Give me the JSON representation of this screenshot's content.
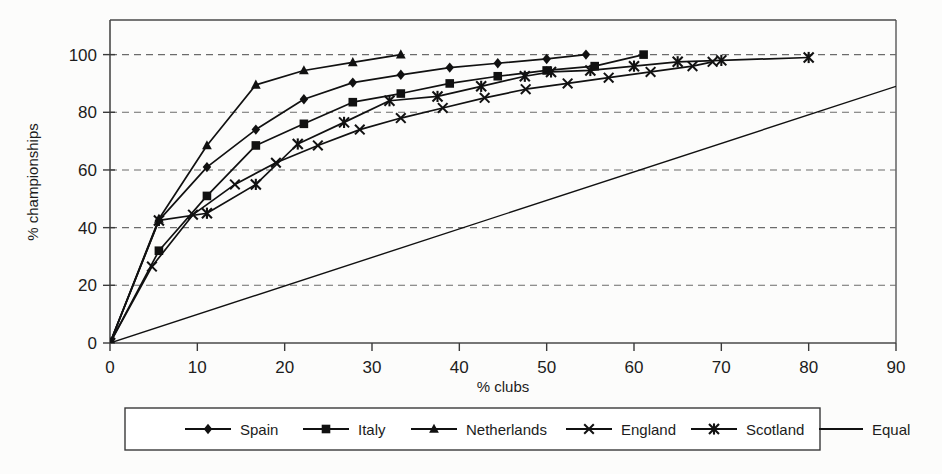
{
  "chart_data": {
    "type": "line",
    "title": "",
    "subtitle": "",
    "xlabel": "% clubs",
    "ylabel": "% championships",
    "xlim": [
      0,
      90
    ],
    "ylim": [
      0,
      112
    ],
    "xticks": [
      0,
      10,
      20,
      30,
      40,
      50,
      60,
      70,
      80,
      90
    ],
    "xtick_labels": [
      "0",
      "10",
      "20",
      "30",
      "40",
      "50",
      "60",
      "70",
      "80",
      "90"
    ],
    "yticks": [
      0,
      20,
      40,
      60,
      80,
      100
    ],
    "ytick_labels": [
      "0",
      "20",
      "40",
      "60",
      "80",
      "100"
    ],
    "grid": "horizontal-dashed",
    "legend_position": "below",
    "series": [
      {
        "name": "Spain",
        "marker": "diamond",
        "color": "#111111",
        "x": [
          0,
          5.6,
          11.1,
          16.7,
          22.2,
          27.8,
          33.3,
          38.9,
          44.4,
          50.0,
          54.5
        ],
        "y": [
          0,
          42.5,
          61.0,
          74.0,
          84.5,
          90.3,
          93.0,
          95.5,
          97.0,
          98.5,
          100.0
        ]
      },
      {
        "name": "Italy",
        "marker": "square",
        "color": "#111111",
        "x": [
          0,
          5.6,
          11.1,
          16.7,
          22.2,
          27.8,
          33.3,
          38.9,
          44.4,
          50.0,
          55.5,
          61.1
        ],
        "y": [
          0,
          32.0,
          51.0,
          68.5,
          76.0,
          83.5,
          86.5,
          90.0,
          92.5,
          94.5,
          96.0,
          100.0
        ]
      },
      {
        "name": "Netherlands",
        "marker": "triangle",
        "color": "#111111",
        "x": [
          0,
          5.6,
          11.1,
          16.7,
          22.2,
          27.8,
          33.3
        ],
        "y": [
          0,
          43.0,
          68.5,
          89.5,
          94.5,
          97.3,
          100.0
        ]
      },
      {
        "name": "England",
        "marker": "x",
        "color": "#111111",
        "x": [
          0,
          4.8,
          9.5,
          14.3,
          19.0,
          23.8,
          28.6,
          33.3,
          38.1,
          42.9,
          47.6,
          52.4,
          57.1,
          61.9,
          66.7,
          69.0
        ],
        "y": [
          0,
          26.5,
          44.5,
          55.0,
          62.5,
          68.5,
          74.0,
          78.0,
          81.5,
          85.0,
          88.0,
          90.0,
          92.0,
          94.0,
          96.0,
          97.5
        ]
      },
      {
        "name": "Scotland",
        "marker": "star",
        "color": "#111111",
        "x": [
          0,
          5.6,
          11.1,
          16.7,
          21.5,
          26.8,
          32.0,
          37.5,
          42.5,
          47.5,
          50.5,
          55.0,
          60.0,
          65.0,
          70.0,
          80.0
        ],
        "y": [
          0,
          42.5,
          45.0,
          55.0,
          69.0,
          76.5,
          84.0,
          85.5,
          89.0,
          92.5,
          94.0,
          94.5,
          96.0,
          97.5,
          98.0,
          99.0
        ]
      },
      {
        "name": "Equal",
        "marker": "none",
        "color": "#111111",
        "x": [
          0,
          90
        ],
        "y": [
          0,
          89
        ]
      }
    ]
  },
  "legend": {
    "items": [
      {
        "label": "Spain",
        "marker": "diamond"
      },
      {
        "label": "Italy",
        "marker": "square"
      },
      {
        "label": "Netherlands",
        "marker": "triangle"
      },
      {
        "label": "England",
        "marker": "x"
      },
      {
        "label": "Scotland",
        "marker": "star"
      },
      {
        "label": "Equal",
        "marker": "none"
      }
    ]
  },
  "axes": {
    "x_title": "% clubs",
    "y_title": "% championships"
  }
}
